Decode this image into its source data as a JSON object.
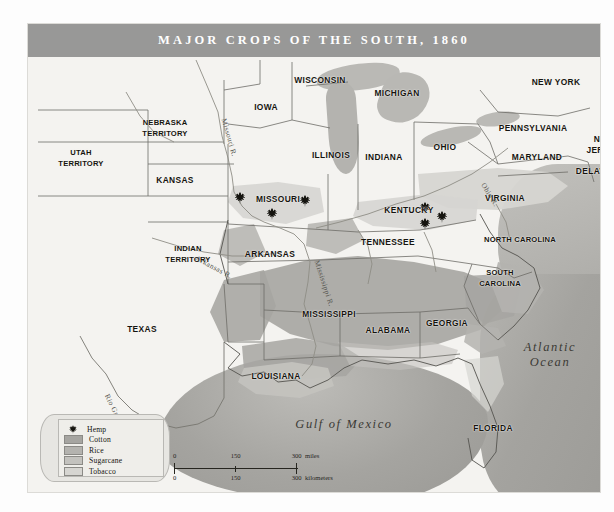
{
  "title": "MAJOR CROPS OF THE SOUTH, 1860",
  "legend": {
    "items": [
      {
        "label": "Hemp",
        "type": "icon",
        "icon": "hemp-leaf-icon",
        "color": "#15140f"
      },
      {
        "label": "Cotton",
        "type": "swatch",
        "color": "#a6a5a1"
      },
      {
        "label": "Rice",
        "type": "swatch",
        "color": "#b4b3af"
      },
      {
        "label": "Sugarcane",
        "type": "swatch",
        "color": "#c3c2be"
      },
      {
        "label": "Tobacco",
        "type": "swatch",
        "color": "#d6d5d1"
      }
    ]
  },
  "scale": {
    "miles": {
      "ticks": [
        "0",
        "150",
        "300"
      ],
      "unit": "miles"
    },
    "kilometers": {
      "ticks": [
        "0",
        "150",
        "300"
      ],
      "unit": "kilometers"
    }
  },
  "places": [
    {
      "name": "WISCONSIN",
      "x": 292,
      "y": 56
    },
    {
      "name": "MICHIGAN",
      "x": 369,
      "y": 69
    },
    {
      "name": "NEW YORK",
      "x": 528,
      "y": 58
    },
    {
      "name": "IOWA",
      "x": 238,
      "y": 83
    },
    {
      "name": "NEBRASKA\nTERRITORY",
      "x": 137,
      "y": 104
    },
    {
      "name": "PENNSYLVANIA",
      "x": 505,
      "y": 104
    },
    {
      "name": "NEW\nJERSEY",
      "x": 576,
      "y": 120
    },
    {
      "name": "UTAH\nTERRITORY",
      "x": 53,
      "y": 134
    },
    {
      "name": "ILLINOIS",
      "x": 303,
      "y": 131
    },
    {
      "name": "INDIANA",
      "x": 356,
      "y": 133
    },
    {
      "name": "OHIO",
      "x": 417,
      "y": 123
    },
    {
      "name": "MARYLAND",
      "x": 509,
      "y": 133
    },
    {
      "name": "DELAWARE",
      "x": 573,
      "y": 147
    },
    {
      "name": "KANSAS",
      "x": 147,
      "y": 156
    },
    {
      "name": "MISSOURI",
      "x": 250,
      "y": 175
    },
    {
      "name": "KENTUCKY",
      "x": 381,
      "y": 186
    },
    {
      "name": "VIRGINIA",
      "x": 477,
      "y": 174
    },
    {
      "name": "INDIAN\nTERRITORY",
      "x": 160,
      "y": 230
    },
    {
      "name": "ARKANSAS",
      "x": 242,
      "y": 230
    },
    {
      "name": "TENNESSEE",
      "x": 360,
      "y": 218
    },
    {
      "name": "NORTH CAROLINA",
      "x": 492,
      "y": 216
    },
    {
      "name": "SOUTH\nCAROLINA",
      "x": 472,
      "y": 254
    },
    {
      "name": "MISSISSIPPI",
      "x": 301,
      "y": 290
    },
    {
      "name": "ALABAMA",
      "x": 360,
      "y": 306
    },
    {
      "name": "GEORGIA",
      "x": 419,
      "y": 299
    },
    {
      "name": "TEXAS",
      "x": 114,
      "y": 305
    },
    {
      "name": "LOUISIANA",
      "x": 248,
      "y": 352
    },
    {
      "name": "FLORIDA",
      "x": 465,
      "y": 404
    }
  ],
  "water_labels": [
    {
      "name": "Atlantic\nOcean",
      "x": 522,
      "y": 331
    },
    {
      "name": "Gulf of Mexico",
      "x": 316,
      "y": 400
    }
  ],
  "rivers": [
    {
      "name": "Missouri R.",
      "x": 196,
      "y": 90,
      "rotate": 74
    },
    {
      "name": "Ohio R.",
      "x": 455,
      "y": 155,
      "rotate": 58
    },
    {
      "name": "Arkansas R.",
      "x": 168,
      "y": 229,
      "rotate": 28
    },
    {
      "name": "Mississippi R.",
      "x": 289,
      "y": 232,
      "rotate": 72
    },
    {
      "name": "Rio Grande",
      "x": 79,
      "y": 366,
      "rotate": 64
    }
  ],
  "hemp_markers": [
    {
      "x": 212,
      "y": 172
    },
    {
      "x": 244,
      "y": 188
    },
    {
      "x": 277,
      "y": 175
    },
    {
      "x": 397,
      "y": 182
    },
    {
      "x": 414,
      "y": 191
    },
    {
      "x": 397,
      "y": 198
    }
  ]
}
